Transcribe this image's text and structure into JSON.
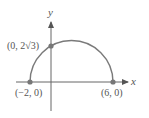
{
  "diagram": {
    "type": "semicircle-graph",
    "axes": {
      "x_label": "x",
      "y_label": "y"
    },
    "points": [
      {
        "label": "(−2, 0)",
        "x": -2,
        "y": 0
      },
      {
        "label": "(6, 0)",
        "x": 6,
        "y": 0
      },
      {
        "label": "(0, 2√3)",
        "x": 0,
        "y": "2√3"
      }
    ],
    "curve": {
      "description": "upper semicircle centered at (2, 0) with radius 4",
      "color": "#7a7a7a"
    },
    "colors": {
      "axis": "#666666",
      "point": "#777777",
      "text": "#555555"
    }
  }
}
